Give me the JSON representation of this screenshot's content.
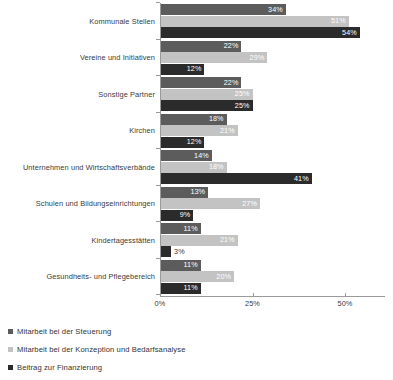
{
  "chart_data": {
    "type": "bar",
    "orientation": "horizontal",
    "title": "",
    "subtitle": "",
    "xlabel": "",
    "ylabel": "",
    "xlim": [
      0,
      60
    ],
    "xticks": [
      0,
      25,
      50
    ],
    "xtick_labels": [
      "0%",
      "25%",
      "50%"
    ],
    "grid": false,
    "legend_position": "bottom-left",
    "value_suffix": "%",
    "categories": [
      "Kommunale Stellen",
      "Vereine und Initiativen",
      "Sonstige Partner",
      "Kirchen",
      "Unternehmen und Wirtschaftsverbände",
      "Schulen und Bildungseinrichtungen",
      "Kindertagesstätten",
      "Gesundheits- und Pflegebereich"
    ],
    "series": [
      {
        "name": "Mitarbeit bei der Steuerung",
        "color": "#5c5c5c",
        "values": [
          34,
          22,
          22,
          18,
          14,
          13,
          11,
          11
        ],
        "labels": [
          "34%",
          "22%",
          "22%",
          "18%",
          "14%",
          "13%",
          "11%",
          "11%"
        ]
      },
      {
        "name": "Mitarbeit bei der Konzeption und Bedarfsanalyse",
        "color": "#c3c3c3",
        "values": [
          51,
          29,
          25,
          21,
          18,
          27,
          21,
          20
        ],
        "labels": [
          "51%",
          "29%",
          "25%",
          "21%",
          "18%",
          "27%",
          "21%",
          "20%"
        ]
      },
      {
        "name": "Beitrag zur Finanzierung",
        "color": "#2b2b2b",
        "values": [
          54,
          12,
          25,
          12,
          41,
          9,
          3,
          11
        ],
        "labels": [
          "54%",
          "12%",
          "25%",
          "12%",
          "41%",
          "9%",
          "3%",
          "11%"
        ]
      }
    ]
  },
  "axis": {
    "tick_labels": [
      "0%",
      "25%",
      "50%"
    ],
    "line_color": "#9a9a9a"
  },
  "legend": {
    "items": [
      {
        "label": "Mitarbeit bei der Steuerung",
        "color": "#5c5c5c"
      },
      {
        "label": "Mitarbeit bei der Konzeption und Bedarfsanalyse",
        "color": "#c3c3c3"
      },
      {
        "label": "Beitrag zur Finanzierung",
        "color": "#2b2b2b"
      }
    ]
  }
}
